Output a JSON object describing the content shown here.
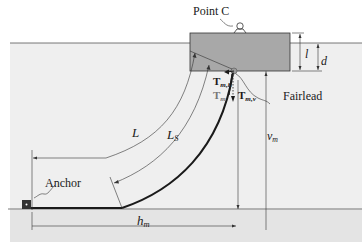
{
  "diagram": {
    "type": "mooring-line-catenary",
    "colors": {
      "water": "#eeeeee",
      "seabed": "#e6e6e6",
      "floater": "#a9a9a9",
      "line": "#1a1a1a",
      "text": "#1a1a1a"
    },
    "labels": {
      "point_c": "Point C",
      "l": "l",
      "d": "d",
      "t_mh_main": "T",
      "t_mh_sub": "m,h",
      "t_m_main": "T",
      "t_m_sub": "m",
      "t_mv_main": "T",
      "t_mv_sub": "m,v",
      "fairlead": "Fairlead",
      "L": "L",
      "Ls_main": "L",
      "Ls_sub": "S",
      "vm_main": "v",
      "vm_sub": "m",
      "anchor": "Anchor",
      "hm_main": "h",
      "hm_sub": "m"
    }
  }
}
